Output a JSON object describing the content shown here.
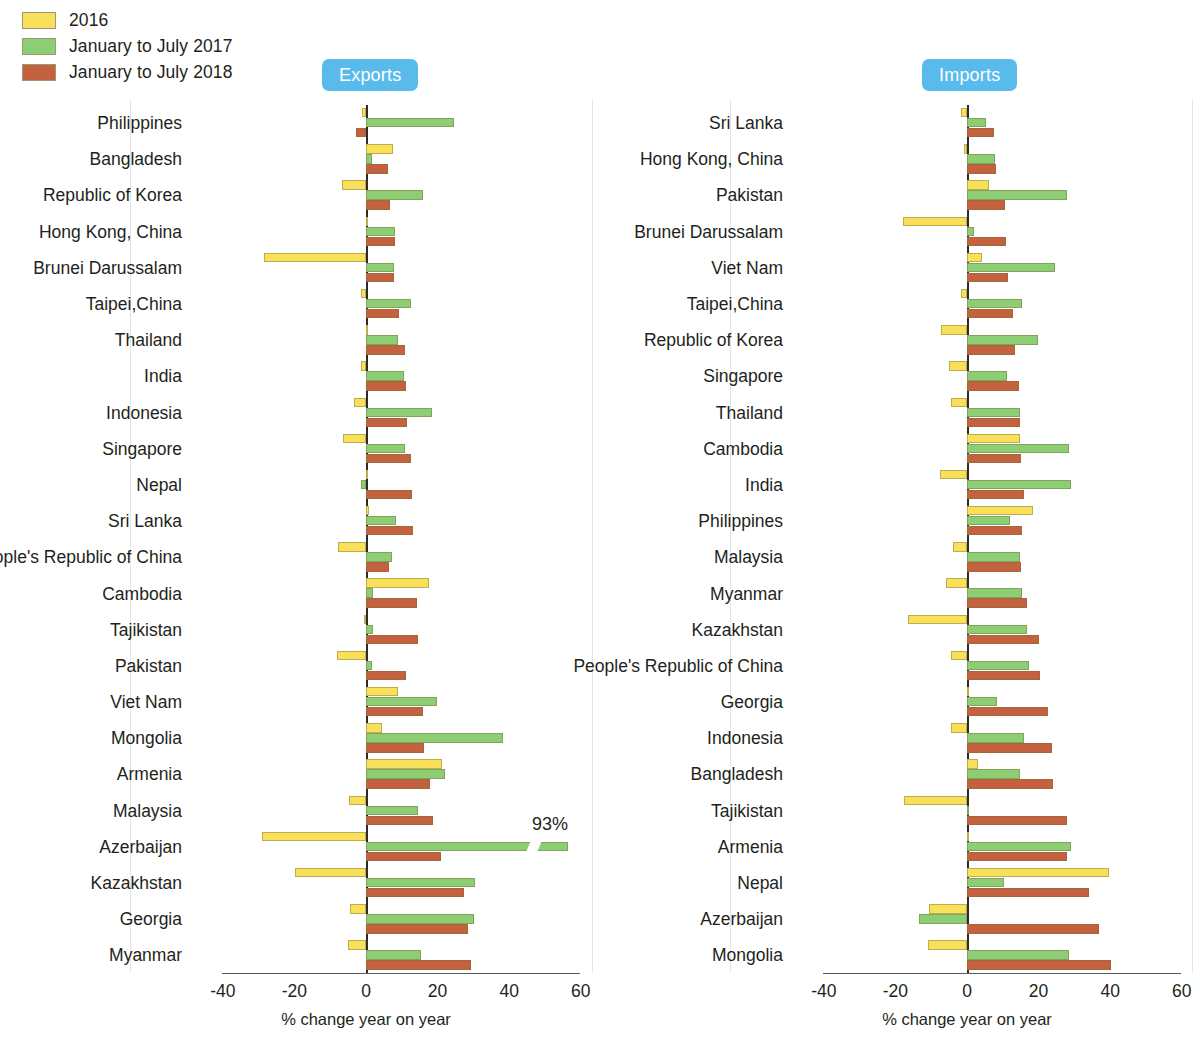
{
  "legend": {
    "items": [
      {
        "label": "2016",
        "color": "#f9e05a"
      },
      {
        "label": "January to July 2017",
        "color": "#8dcd73"
      },
      {
        "label": "January to July 2018",
        "color": "#c4613f"
      }
    ]
  },
  "badge_color": "#59bbeb",
  "axis": {
    "ticks": [
      "-40",
      "-20",
      "0",
      "20",
      "40",
      "60"
    ],
    "tick_values": [
      -40,
      -20,
      0,
      20,
      40,
      60
    ],
    "title": "% change year on year",
    "min": -40,
    "max": 60
  },
  "panels": [
    {
      "id": "exports",
      "badge": "Exports"
    },
    {
      "id": "imports",
      "badge": "Imports"
    }
  ],
  "annotation": {
    "text": "93%"
  },
  "chart_data": [
    {
      "type": "bar",
      "title": "Exports",
      "orientation": "horizontal",
      "xlabel": "% change year on year",
      "ylabel": "",
      "xlim": [
        -40,
        60
      ],
      "grid": false,
      "legend_position": "top-left",
      "categories": [
        "Philippines",
        "Bangladesh",
        "Republic of Korea",
        "Hong Kong, China",
        "Brunei Darussalam",
        "Taipei,China",
        "Thailand",
        "India",
        "Indonesia",
        "Singapore",
        "Nepal",
        "Sri Lanka",
        "People's Republic of China",
        "Cambodia",
        "Tajikistan",
        "Pakistan",
        "Viet Nam",
        "Mongolia",
        "Armenia",
        "Malaysia",
        "Azerbaijan",
        "Kazakhstan",
        "Georgia",
        "Myanmar"
      ],
      "series": [
        {
          "name": "2016",
          "color": "#f9e05a",
          "values": [
            -1.2,
            7.5,
            -6.6,
            0.6,
            -28.5,
            -1.3,
            0.5,
            -1.5,
            -3.3,
            -6.5,
            0.0,
            0.8,
            -7.8,
            17.5,
            -0.5,
            -8.0,
            8.8,
            4.6,
            21.2,
            -4.8,
            -29.0,
            -19.8,
            -4.5,
            -5.0
          ]
        },
        {
          "name": "January to July 2017",
          "color": "#8dcd73",
          "values": [
            24.5,
            1.8,
            16.0,
            8.2,
            7.8,
            12.5,
            8.8,
            10.5,
            18.5,
            10.8,
            -1.5,
            8.5,
            7.2,
            2.0,
            2.0,
            1.6,
            19.8,
            38.2,
            22.0,
            14.5,
            56.5,
            30.5,
            30.2,
            15.5
          ]
        },
        {
          "name": "January to July 2018",
          "color": "#c4613f",
          "values": [
            -2.7,
            6.2,
            6.8,
            8.0,
            7.8,
            9.2,
            10.8,
            11.2,
            11.5,
            12.5,
            12.8,
            13.0,
            6.4,
            14.2,
            14.5,
            11.2,
            15.8,
            16.2,
            18.0,
            18.6,
            21.0,
            27.5,
            28.5,
            29.2
          ]
        }
      ],
      "annotations": [
        {
          "text": "93%",
          "category": "Azerbaijan",
          "series": "January to July 2017",
          "note": "bar truncated with axis break"
        }
      ]
    },
    {
      "type": "bar",
      "title": "Imports",
      "orientation": "horizontal",
      "xlabel": "% change year on year",
      "ylabel": "",
      "xlim": [
        -40,
        60
      ],
      "grid": false,
      "legend_position": "top-left",
      "categories": [
        "Sri Lanka",
        "Hong Kong, China",
        "Pakistan",
        "Brunei Darussalam",
        "Viet Nam",
        "Taipei,China",
        "Republic of Korea",
        "Singapore",
        "Thailand",
        "Cambodia",
        "India",
        "Philippines",
        "Malaysia",
        "Myanmar",
        "Kazakhstan",
        "People's Republic of China",
        "Georgia",
        "Indonesia",
        "Bangladesh",
        "Tajikistan",
        "Armenia",
        "Nepal",
        "Azerbaijan",
        "Mongolia"
      ],
      "series": [
        {
          "name": "2016",
          "color": "#f9e05a",
          "values": [
            -1.8,
            -0.8,
            6.2,
            -18.0,
            4.2,
            -1.8,
            -7.2,
            -5.0,
            -4.5,
            14.8,
            -7.5,
            18.5,
            -3.8,
            -6.0,
            -16.5,
            -4.5,
            0.2,
            -4.5,
            3.2,
            -17.5,
            0.5,
            39.8,
            -10.5,
            -11.0
          ]
        },
        {
          "name": "January to July 2017",
          "color": "#8dcd73",
          "values": [
            5.2,
            7.8,
            28.0,
            2.0,
            24.5,
            15.5,
            19.8,
            11.2,
            14.8,
            28.5,
            29.0,
            12.0,
            14.8,
            15.5,
            16.8,
            17.2,
            8.5,
            15.8,
            14.8,
            0.5,
            29.0,
            10.2,
            -13.5,
            28.5
          ]
        },
        {
          "name": "January to July 2018",
          "color": "#c4613f",
          "values": [
            7.5,
            8.2,
            10.5,
            11.0,
            11.5,
            12.8,
            13.5,
            14.5,
            14.8,
            15.0,
            15.8,
            15.5,
            15.0,
            16.8,
            20.2,
            20.5,
            22.5,
            23.8,
            24.0,
            27.8,
            28.0,
            34.0,
            37.0,
            40.2
          ]
        }
      ]
    }
  ]
}
